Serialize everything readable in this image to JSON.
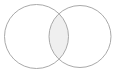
{
  "figure": {
    "name": "two-set-venn-diagram",
    "type": "venn",
    "title": "",
    "background_color": "#ffffff",
    "width": 117,
    "height": 74
  },
  "chart_data": {
    "type": "venn",
    "title": "",
    "subtitle": "",
    "xlabel": "",
    "ylabel": "",
    "grid": false,
    "legend_position": "none",
    "labels_visible": false,
    "sets": [
      {
        "name": "left-set",
        "label": "",
        "center_x": 36.5,
        "center_y": 36.5,
        "radius": 32,
        "fill": "#ffffff",
        "stroke": "#a9a9a9",
        "stroke_width": 1
      },
      {
        "name": "right-set",
        "label": "",
        "center_x": 80,
        "center_y": 36.5,
        "radius": 31,
        "fill": "#ffffff",
        "stroke": "#a9a9a9",
        "stroke_width": 1
      }
    ],
    "intersection": {
      "name": "overlap-lens",
      "label": "",
      "fill": "#efefef",
      "stroke": "#a9a9a9",
      "left_extent_x": 49,
      "right_extent_x": 67.5,
      "top_point_x": 58.2,
      "top_point_y": 10.2,
      "bottom_point_x": 58.2,
      "bottom_point_y": 62.8,
      "highlighted": true
    },
    "colors": {
      "stroke": "#a9a9a9",
      "set_fill": "#ffffff",
      "intersection_fill": "#efefef",
      "background": "#ffffff"
    }
  }
}
